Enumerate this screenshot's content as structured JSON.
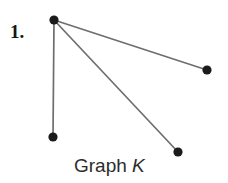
{
  "canvas": {
    "width": 228,
    "height": 183,
    "background": "#ffffff"
  },
  "labels": {
    "item_number": "1.",
    "caption_prefix": "Graph ",
    "caption_name": "K"
  },
  "chart_data": {
    "type": "diagram",
    "title": "Graph K",
    "colors": {
      "vertex_fill": "#1b1b1b",
      "edge_stroke": "#6e6e6e",
      "text": "#2c2c2c",
      "background": "#ffffff"
    },
    "vertices": [
      {
        "id": "v1",
        "label": "",
        "x": 54,
        "y": 20,
        "r": 4.6
      },
      {
        "id": "v2",
        "label": "",
        "x": 207,
        "y": 70,
        "r": 4.6
      },
      {
        "id": "v3",
        "label": "",
        "x": 53,
        "y": 137,
        "r": 4.6
      },
      {
        "id": "v4",
        "label": "",
        "x": 178,
        "y": 152,
        "r": 4.6
      }
    ],
    "edges": [
      {
        "from": "v1",
        "to": "v2"
      },
      {
        "from": "v1",
        "to": "v3"
      },
      {
        "from": "v1",
        "to": "v4"
      }
    ],
    "degrees": {
      "v1": 3,
      "v2": 1,
      "v3": 1,
      "v4": 1
    },
    "vertex_count": 4,
    "edge_count": 3
  }
}
